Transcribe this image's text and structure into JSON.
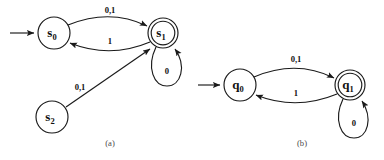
{
  "figure": {
    "background_color": "#ffffff",
    "stroke_color": "#1a1a1a",
    "label_color": "#111111",
    "caption_color": "#4a4a4a"
  },
  "diagrams": [
    {
      "id": "a",
      "caption": "(a)",
      "caption_x": 110,
      "caption_y": 146,
      "states": [
        {
          "name": "s0",
          "base": "s",
          "sub": "0",
          "cx": 54,
          "cy": 33,
          "r": 16,
          "accepting": false,
          "start": true
        },
        {
          "name": "s1",
          "base": "s",
          "sub": "1",
          "cx": 163,
          "cy": 33,
          "r": 15,
          "accepting": true,
          "start": false
        },
        {
          "name": "s2",
          "base": "s",
          "sub": "2",
          "cx": 52,
          "cy": 117,
          "r": 16,
          "accepting": false,
          "start": false
        }
      ],
      "transitions": [
        {
          "from": "s0",
          "to": "s1",
          "label": "0,1",
          "label_x": 110,
          "label_y": 13
        },
        {
          "from": "s1",
          "to": "s0",
          "label": "1",
          "label_x": 110,
          "label_y": 44
        },
        {
          "from": "s1",
          "to": "s1",
          "label": "0",
          "label_x": 167,
          "label_y": 73,
          "self_loop": true
        },
        {
          "from": "s2",
          "to": "s1",
          "label": "0,1",
          "label_x": 80,
          "label_y": 89
        }
      ]
    },
    {
      "id": "b",
      "caption": "(b)",
      "caption_x": 302,
      "caption_y": 146,
      "states": [
        {
          "name": "q0",
          "base": "q",
          "sub": "0",
          "cx": 240,
          "cy": 85,
          "r": 16,
          "accepting": false,
          "start": true
        },
        {
          "name": "q1",
          "base": "q",
          "sub": "1",
          "cx": 350,
          "cy": 85,
          "r": 15,
          "accepting": true,
          "start": false
        }
      ],
      "transitions": [
        {
          "from": "q0",
          "to": "q1",
          "label": "0,1",
          "label_x": 296,
          "label_y": 62
        },
        {
          "from": "q1",
          "to": "q0",
          "label": "1",
          "label_x": 296,
          "label_y": 95
        },
        {
          "from": "q1",
          "to": "q1",
          "label": "0",
          "label_x": 353,
          "label_y": 124,
          "self_loop": true
        }
      ]
    }
  ],
  "alphabet": [
    "0",
    "1"
  ]
}
